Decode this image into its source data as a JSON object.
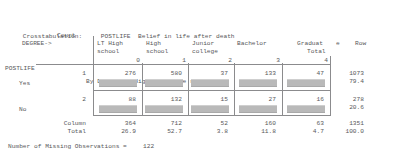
{
  "report": {
    "heading": {
      "label": "Crosstabulation:",
      "row_var_name": "POSTLIFE",
      "row_var_desc": "Belief in life after death",
      "by_label": "By",
      "col_var_name": "DEGREE",
      "col_var_desc": "Highest degree received"
    },
    "stub": {
      "count_label": "Count",
      "col_var_arrow": "DEGREE->",
      "row_var_name": "POSTLIFE",
      "row_total_label_line1": "Row",
      "row_total_label_line2": "Total",
      "column_total_line1": "Column",
      "column_total_line2": "Total"
    },
    "column_headers": [
      {
        "line1": "LT High",
        "line2": "school",
        "code": "0"
      },
      {
        "line1": "High",
        "line2": "school",
        "code": "1"
      },
      {
        "line1": "Junior",
        "line2": "college",
        "code": "2"
      },
      {
        "line1": "Bachelor",
        "line2": "",
        "code": "3"
      },
      {
        "line1": "Graduat",
        "line2": "",
        "code": "4",
        "trailing": "e"
      }
    ],
    "rows": [
      {
        "code": "1",
        "label": "Yes",
        "counts": [
          "276",
          "580",
          "37",
          "133",
          "47"
        ],
        "row_total": "1073",
        "row_pct": "79.4"
      },
      {
        "code": "2",
        "label": "No",
        "counts": [
          "88",
          "132",
          "15",
          "27",
          "16"
        ],
        "row_total": "278",
        "row_pct": "20.6"
      }
    ],
    "column_totals": {
      "counts": [
        "364",
        "712",
        "52",
        "160",
        "63"
      ],
      "percents": [
        "26.9",
        "52.7",
        "3.8",
        "11.8",
        "4.7"
      ],
      "grand_total": "1351",
      "grand_pct": "100.0"
    },
    "footer": {
      "missing_label": "Number of Missing Observations =",
      "missing_value": "122"
    },
    "colors": {
      "text": "#58585a",
      "rule": "#8b8b8d",
      "redaction": "#b9b9b9",
      "background": "#ffffff"
    }
  }
}
